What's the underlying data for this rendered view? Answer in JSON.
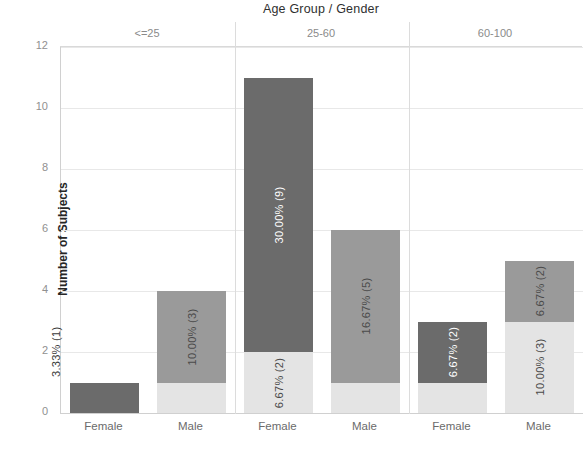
{
  "chart_data": {
    "type": "bar",
    "title": "Age Group / Gender",
    "xlabel": "",
    "ylabel": "Number of Subjects",
    "ylim": [
      0,
      12
    ],
    "yticks": [
      "0",
      "2",
      "4",
      "6",
      "8",
      "10",
      "12"
    ],
    "grid": true,
    "legend": "none",
    "stacked": true,
    "group_label_position": "top",
    "groups": [
      "<=25",
      "25-60",
      "60-100"
    ],
    "categories": [
      "Female",
      "Male",
      "Female",
      "Male",
      "Female",
      "Male"
    ],
    "colors": {
      "female_top": "#6b6b6b",
      "male_top": "#9a9a9a",
      "bottom": "#e4e4e4",
      "grid": "#e8e8e8",
      "axis": "#d0d0d0",
      "title_text": "#2f2f2f",
      "tick_text": "#909090",
      "group_text": "#8a8a8a"
    },
    "bars": [
      {
        "group": "<=25",
        "gender": "Female",
        "total": 1,
        "segments": [
          {
            "part": "top",
            "value": 1,
            "label": "3.33% (1)",
            "label_placement": "outside-above",
            "color": "#6b6b6b"
          }
        ]
      },
      {
        "group": "<=25",
        "gender": "Male",
        "total": 4,
        "segments": [
          {
            "part": "bottom",
            "value": 1,
            "label": "",
            "label_placement": "none",
            "color": "#e4e4e4"
          },
          {
            "part": "top",
            "value": 3,
            "label": "10.00% (3)",
            "label_placement": "inside",
            "color": "#9a9a9a"
          }
        ]
      },
      {
        "group": "25-60",
        "gender": "Female",
        "total": 11,
        "segments": [
          {
            "part": "bottom",
            "value": 2,
            "label": "6.67% (2)",
            "label_placement": "inside",
            "color": "#e4e4e4"
          },
          {
            "part": "top",
            "value": 9,
            "label": "30.00% (9)",
            "label_placement": "inside",
            "color": "#6b6b6b"
          }
        ]
      },
      {
        "group": "25-60",
        "gender": "Male",
        "total": 6,
        "segments": [
          {
            "part": "bottom",
            "value": 1,
            "label": "",
            "label_placement": "none",
            "color": "#e4e4e4"
          },
          {
            "part": "top",
            "value": 5,
            "label": "16.67% (5)",
            "label_placement": "inside",
            "color": "#9a9a9a"
          }
        ]
      },
      {
        "group": "60-100",
        "gender": "Female",
        "total": 3,
        "segments": [
          {
            "part": "bottom",
            "value": 1,
            "label": "",
            "label_placement": "none",
            "color": "#e4e4e4"
          },
          {
            "part": "top",
            "value": 2,
            "label": "6.67% (2)",
            "label_placement": "inside",
            "color": "#6b6b6b"
          }
        ]
      },
      {
        "group": "60-100",
        "gender": "Male",
        "total": 5,
        "segments": [
          {
            "part": "bottom",
            "value": 3,
            "label": "10.00% (3)",
            "label_placement": "inside",
            "color": "#e4e4e4"
          },
          {
            "part": "top",
            "value": 2,
            "label": "6.67% (2)",
            "label_placement": "inside",
            "color": "#9a9a9a"
          }
        ]
      }
    ]
  }
}
